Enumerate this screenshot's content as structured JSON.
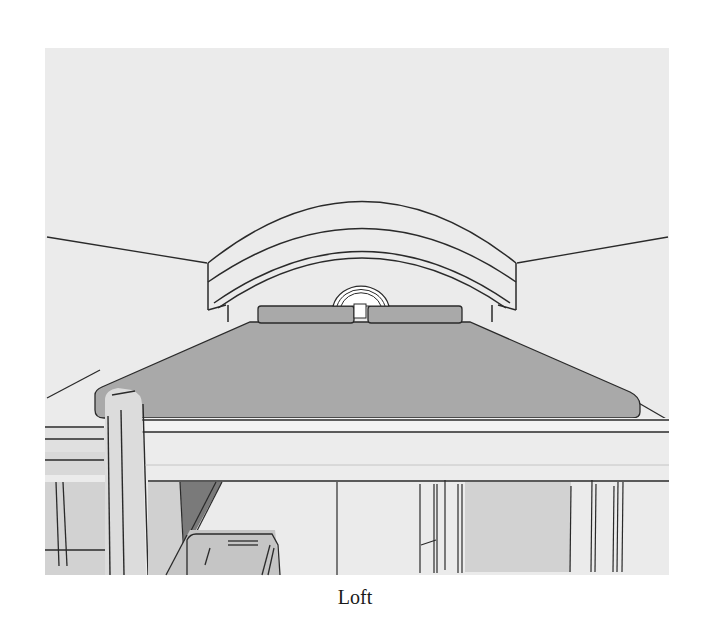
{
  "figure": {
    "caption": "Loft",
    "colors": {
      "page_background": "#ffffff",
      "scene_background": "#ebebeb",
      "deck_fill": "#a9a9a9",
      "wall_fill": "#d2d2d2",
      "light_fill": "#f2f2f2",
      "skylight_fill": "#ffffff",
      "line": "#2a2a2a"
    }
  }
}
